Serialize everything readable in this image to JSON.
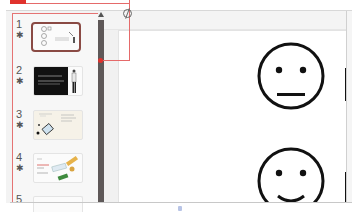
{
  "app": "presentation-editor",
  "annotation": {
    "callout_color": "#e0322d",
    "callout_line_color": "#e56a6a",
    "target": "slide-panel-scrollbar"
  },
  "slide_panel": {
    "slides": [
      {
        "number": "1",
        "marker": "✱",
        "selected": true,
        "thumb_style": "emoji-faces"
      },
      {
        "number": "2",
        "marker": "✱",
        "selected": false,
        "thumb_style": "dark-with-person"
      },
      {
        "number": "3",
        "marker": "✱",
        "selected": false,
        "thumb_style": "beige-diagram"
      },
      {
        "number": "4",
        "marker": "✱",
        "selected": false,
        "thumb_style": "colorful-illustration"
      },
      {
        "number": "5",
        "marker": "",
        "selected": false,
        "thumb_style": "blank"
      }
    ]
  },
  "slide_canvas": {
    "faces": [
      "neutral-face",
      "smiling-face"
    ]
  }
}
